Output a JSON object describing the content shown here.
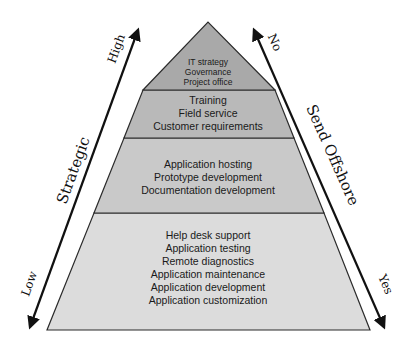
{
  "diagram": {
    "type": "pyramid",
    "colors": {
      "tier1_fill": "#a9a9a9",
      "tier2_fill": "#b9b9b9",
      "tier3_fill": "#c9c9c9",
      "tier4_fill": "#dcdcdc",
      "outline": "#2b2b2b",
      "arrow": "#111111"
    },
    "tiers": [
      {
        "lines": [
          "IT strategy",
          "Governance",
          "Project office"
        ]
      },
      {
        "lines": [
          "Training",
          "Field service",
          "Customer requirements"
        ]
      },
      {
        "lines": [
          "Application hosting",
          "Prototype development",
          "Documentation development"
        ]
      },
      {
        "lines": [
          "Help desk support",
          "Application testing",
          "Remote diagnostics",
          "Application maintenance",
          "Application development",
          "Application customization"
        ]
      }
    ],
    "left_axis": {
      "title": "Strategic",
      "top_label": "High",
      "bottom_label": "Low"
    },
    "right_axis": {
      "title": "Send Offshore",
      "top_label": "No",
      "bottom_label": "Yes"
    }
  }
}
